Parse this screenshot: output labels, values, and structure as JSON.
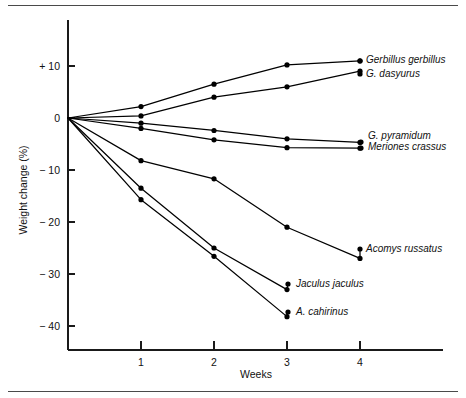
{
  "figure": {
    "rule_top_name": "top-divider",
    "rule_bottom_name": "bottom-divider"
  },
  "chart_data": {
    "type": "line",
    "title": "",
    "subtitle": "",
    "xlabel": "Weeks",
    "ylabel": "Weight change (%)",
    "x": [
      0,
      1,
      2,
      3,
      4
    ],
    "xticks": [
      "1",
      "2",
      "3",
      "4"
    ],
    "xtick_values": [
      1,
      2,
      3,
      4
    ],
    "xlim": [
      0,
      4.6
    ],
    "yticks": [
      "+ 10",
      "0",
      "− 10",
      "− 20",
      "− 30",
      "− 40"
    ],
    "ytick_values": [
      10,
      0,
      -10,
      -20,
      -30,
      -40
    ],
    "ylim": [
      -44,
      16
    ],
    "grid": false,
    "legend_position": "right-of-line-ends",
    "marker": "filled-circle",
    "line_color": "#000000",
    "series": [
      {
        "name": "Gerbillus gerbillus",
        "label": "Gerbillus gerbillus",
        "x": [
          0,
          1,
          2,
          3,
          4
        ],
        "values": [
          0,
          2.2,
          6.5,
          10.2,
          11.0
        ]
      },
      {
        "name": "G. dasyurus",
        "label": "G. dasyurus",
        "x": [
          0,
          1,
          2,
          3,
          4
        ],
        "values": [
          0,
          0.4,
          4.0,
          6.0,
          9.0
        ]
      },
      {
        "name": "G. pyramidum",
        "label": "G. pyramidum",
        "x": [
          0,
          1,
          2,
          3,
          4
        ],
        "values": [
          0,
          -1.0,
          -2.4,
          -4.0,
          -4.7
        ]
      },
      {
        "name": "Meriones crassus",
        "label": "Meriones crassus",
        "x": [
          0,
          1,
          2,
          3,
          4
        ],
        "values": [
          0,
          -2.0,
          -4.2,
          -5.7,
          -5.8
        ]
      },
      {
        "name": "Acomys russatus",
        "label": "Acomys russatus",
        "x": [
          0,
          1,
          2,
          3,
          4
        ],
        "values": [
          0,
          -8.2,
          -11.7,
          -21.0,
          -27.0
        ]
      },
      {
        "name": "Jaculus jaculus",
        "label": "Jaculus jaculus",
        "x": [
          0,
          1,
          2,
          3
        ],
        "values": [
          0,
          -13.5,
          -25.0,
          -33.0
        ]
      },
      {
        "name": "A. cahirinus",
        "label": "A. cahirinus",
        "x": [
          0,
          1,
          2,
          3
        ],
        "values": [
          0,
          -15.7,
          -26.6,
          -38.2
        ]
      }
    ]
  }
}
